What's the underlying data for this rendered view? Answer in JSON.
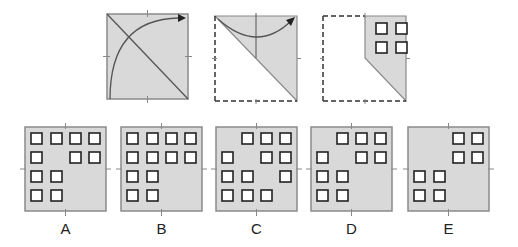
{
  "puzzle": {
    "colors": {
      "paper_fill": "#d9d9d9",
      "paper_stroke": "#8a8a8a",
      "line": "#555555",
      "hole_stroke": "#222222",
      "hole_fill": "#ffffff"
    },
    "steps": [
      {
        "name": "step-1-fold-diagonal",
        "description": "Square paper with diagonal fold line and arc arrow from bottom-left to top-right"
      },
      {
        "name": "step-2-folded-triangle",
        "description": "Triangle after folding, dashed outline of original, arc arrow folding left half to right"
      },
      {
        "name": "step-3-punched",
        "description": "Folded shape with 4 holes punched in top-right quadrant"
      }
    ],
    "step3_holes": [
      [
        0,
        0
      ],
      [
        1,
        0
      ],
      [
        0,
        1
      ],
      [
        1,
        1
      ]
    ],
    "options": [
      {
        "label": "A",
        "holes": [
          [
            0,
            0
          ],
          [
            1,
            0
          ],
          [
            2,
            0
          ],
          [
            3,
            0
          ],
          [
            0,
            1
          ],
          [
            2,
            1
          ],
          [
            3,
            1
          ],
          [
            0,
            2
          ],
          [
            1,
            2
          ],
          [
            0,
            3
          ],
          [
            1,
            3
          ]
        ]
      },
      {
        "label": "B",
        "holes": [
          [
            0,
            0
          ],
          [
            1,
            0
          ],
          [
            2,
            0
          ],
          [
            3,
            0
          ],
          [
            0,
            1
          ],
          [
            1,
            1
          ],
          [
            2,
            1
          ],
          [
            3,
            1
          ],
          [
            0,
            2
          ],
          [
            1,
            2
          ],
          [
            0,
            3
          ],
          [
            1,
            3
          ]
        ]
      },
      {
        "label": "C",
        "holes": [
          [
            1,
            0
          ],
          [
            2,
            0
          ],
          [
            3,
            0
          ],
          [
            0,
            1
          ],
          [
            2,
            1
          ],
          [
            3,
            1
          ],
          [
            0,
            2
          ],
          [
            1,
            2
          ],
          [
            3,
            2
          ],
          [
            0,
            3
          ],
          [
            1,
            3
          ],
          [
            2,
            3
          ]
        ]
      },
      {
        "label": "D",
        "holes": [
          [
            1,
            0
          ],
          [
            2,
            0
          ],
          [
            3,
            0
          ],
          [
            0,
            1
          ],
          [
            2,
            1
          ],
          [
            3,
            1
          ],
          [
            0,
            2
          ],
          [
            1,
            2
          ],
          [
            0,
            3
          ],
          [
            1,
            3
          ]
        ]
      },
      {
        "label": "E",
        "holes": [
          [
            2,
            0
          ],
          [
            3,
            0
          ],
          [
            2,
            1
          ],
          [
            3,
            1
          ],
          [
            0,
            2
          ],
          [
            1,
            2
          ],
          [
            0,
            3
          ],
          [
            1,
            3
          ]
        ]
      }
    ]
  }
}
